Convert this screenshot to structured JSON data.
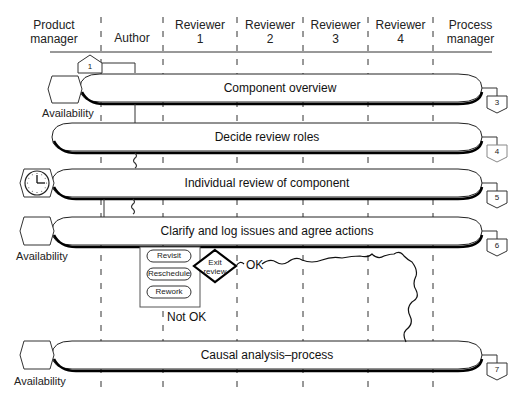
{
  "lanes": [
    {
      "label": "Product\nmanager",
      "line1": "Product",
      "line2": "manager"
    },
    {
      "label": "Author",
      "line1": "Author",
      "line2": ""
    },
    {
      "label": "Reviewer 1",
      "line1": "Reviewer",
      "line2": "1"
    },
    {
      "label": "Reviewer 2",
      "line1": "Reviewer",
      "line2": "2"
    },
    {
      "label": "Reviewer 3",
      "line1": "Reviewer",
      "line2": "3"
    },
    {
      "label": "Reviewer 4",
      "line1": "Reviewer",
      "line2": "4"
    },
    {
      "label": "Process manager",
      "line1": "Process",
      "line2": "manager"
    }
  ],
  "steps": [
    {
      "number": "1",
      "label": ""
    },
    {
      "number": "3",
      "label": "Component overview",
      "resource": "Availability"
    },
    {
      "number": "4",
      "label": "Decide review roles",
      "resource": ""
    },
    {
      "number": "5",
      "label": "Individual review of component",
      "resource": "clock"
    },
    {
      "number": "6",
      "label": "Clarify and log issues and agree actions",
      "resource": "Availability"
    },
    {
      "number": "7",
      "label": "Causal analysis–process",
      "resource": "Availability"
    }
  ],
  "decision": {
    "label_line1": "Exit",
    "label_line2": "review",
    "ok_label": "OK",
    "not_ok_label": "Not OK",
    "options": [
      "Revisit",
      "Reschedule",
      "Rework"
    ]
  },
  "resource_label": "Availability"
}
